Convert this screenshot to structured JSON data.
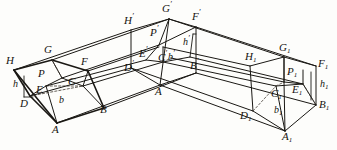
{
  "figure": {
    "kind": "line-diagram",
    "stroke_color": "#1a1814",
    "background_color": "#fdfdfb",
    "dash_color": "#4a443c"
  },
  "labels": {
    "left_section": {
      "H": "H",
      "G": "G",
      "F": "F",
      "P": "P",
      "E": "E",
      "C": "C",
      "D": "D",
      "A": "A",
      "B": "B",
      "h": "h",
      "b": "b"
    },
    "middle_section": {
      "Hp": "H",
      "Gp": "G",
      "Fp": "F",
      "Pp": "P",
      "Ep": "E",
      "Cp": "C",
      "Dp": "D",
      "Ap": "A",
      "Bp": "B",
      "hp": "h",
      "bp": "b",
      "prime": "′"
    },
    "right_section": {
      "H1": "H",
      "G1": "G",
      "F1": "F",
      "P1": "P",
      "E1": "E",
      "C1": "C",
      "D1": "D",
      "A1": "A",
      "B1": "B",
      "h1": "h",
      "b1": "b",
      "sub": "1"
    }
  }
}
